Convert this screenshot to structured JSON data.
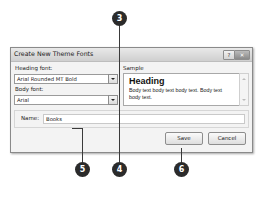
{
  "dialog": {
    "title": "Create New Theme Fonts",
    "help_button": "?",
    "close_button": "✕",
    "heading_font": {
      "label": "Heading font:",
      "value": "Arial Rounded MT Bold"
    },
    "body_font": {
      "label": "Body font:",
      "value": "Arial"
    },
    "sample": {
      "label": "Sample",
      "heading": "Heading",
      "body": "Body text body text body text. Body text body text."
    },
    "name": {
      "label": "Name:",
      "value": "Books"
    },
    "save_label": "Save",
    "cancel_label": "Cancel"
  },
  "callouts": [
    {
      "number": "3"
    },
    {
      "number": "4"
    },
    {
      "number": "5"
    },
    {
      "number": "6"
    }
  ]
}
